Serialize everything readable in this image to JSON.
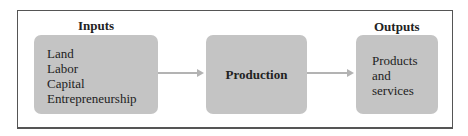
{
  "diagram": {
    "inputs": {
      "title": "Inputs",
      "items": [
        "Land",
        "Labor",
        "Capital",
        "Entrepreneurship"
      ]
    },
    "process": {
      "label": "Production"
    },
    "outputs": {
      "title": "Outputs",
      "items": [
        "Products",
        "and",
        "services"
      ]
    },
    "colors": {
      "box_fill": "#c4c4c4",
      "arrow": "#b3b3b3",
      "frame": "#555555"
    }
  }
}
